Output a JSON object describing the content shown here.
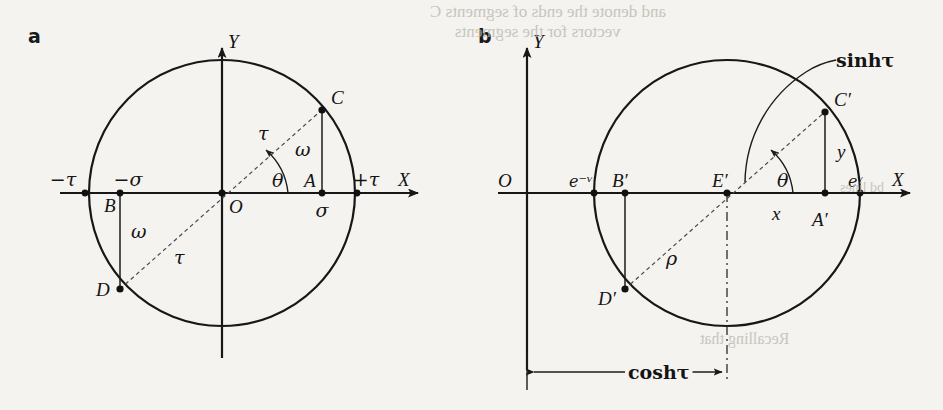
{
  "figure": {
    "background_color": "#f4f3ef",
    "ink_color": "#141414",
    "panels": [
      {
        "id": "a",
        "letter": "a",
        "type": "circle-diagram",
        "geometry": {
          "center": [
            222,
            193
          ],
          "radius": 133,
          "theta_deg": 38
        },
        "axes": {
          "x_label": "X",
          "y_label": "Y",
          "origin_label": "O"
        },
        "points": [
          {
            "name": "C",
            "label": "C",
            "x": 322,
            "y": 110
          },
          {
            "name": "A",
            "label": "A",
            "x": 322,
            "y": 193
          },
          {
            "name": "B",
            "label": "B",
            "x": 120,
            "y": 193
          },
          {
            "name": "D",
            "label": "D",
            "x": 120,
            "y": 289
          },
          {
            "name": "O",
            "label": "O",
            "x": 222,
            "y": 193
          }
        ],
        "tick_labels": [
          {
            "name": "minus-tau",
            "label": "−τ",
            "x": 85,
            "y": 193
          },
          {
            "name": "minus-sigma",
            "label": "−σ",
            "x": 120,
            "y": 193
          },
          {
            "name": "sigma",
            "label": "σ",
            "x": 322,
            "y": 193
          },
          {
            "name": "plus-tau",
            "label": "+τ",
            "x": 357,
            "y": 193
          }
        ],
        "segment_labels": [
          {
            "name": "tau-upper",
            "label": "τ",
            "x": 265,
            "y": 133
          },
          {
            "name": "tau-lower",
            "label": "τ",
            "x": 180,
            "y": 258
          },
          {
            "name": "omega-upper",
            "label": "ω",
            "x": 300,
            "y": 150
          },
          {
            "name": "omega-lower",
            "label": "ω",
            "x": 138,
            "y": 232
          },
          {
            "name": "theta",
            "label": "θ",
            "x": 278,
            "y": 180
          }
        ]
      },
      {
        "id": "b",
        "letter": "b",
        "type": "circle-diagram",
        "geometry": {
          "center": [
            727,
            193
          ],
          "radius": 133,
          "theta_deg": 38
        },
        "axes": {
          "x_label": "X",
          "y_label": "Y",
          "origin_label": "O",
          "origin_x": 527
        },
        "points": [
          {
            "name": "C-prime",
            "label": "C′",
            "x": 825,
            "y": 112
          },
          {
            "name": "A-prime",
            "label": "A′",
            "x": 825,
            "y": 193
          },
          {
            "name": "B-prime",
            "label": "B′",
            "x": 625,
            "y": 193
          },
          {
            "name": "D-prime",
            "label": "D′",
            "x": 625,
            "y": 289
          },
          {
            "name": "E-prime",
            "label": "E′",
            "x": 727,
            "y": 193
          }
        ],
        "tick_labels": [
          {
            "name": "e-minus-tau",
            "label": "e⁻ᵛ",
            "x": 594,
            "y": 193
          },
          {
            "name": "e-tau",
            "label": "eᵛ",
            "x": 860,
            "y": 193
          }
        ],
        "segment_labels": [
          {
            "name": "sinh-tau",
            "label": "sinhτ"
          },
          {
            "name": "cosh-tau",
            "label": "coshτ"
          },
          {
            "name": "rho",
            "label": "ρ",
            "x": 672,
            "y": 258
          },
          {
            "name": "x-coord",
            "label": "x",
            "x": 778,
            "y": 214
          },
          {
            "name": "y-coord",
            "label": "y",
            "x": 842,
            "y": 152
          },
          {
            "name": "theta",
            "label": "θ",
            "x": 783,
            "y": 180
          }
        ]
      }
    ],
    "ghost_text": [
      {
        "name": "ghost-line-1",
        "text": "and denote the ends of segments C",
        "x": 430,
        "y": 2,
        "size": 17
      },
      {
        "name": "ghost-line-2",
        "text": "vectors for the segments",
        "x": 455,
        "y": 22,
        "size": 17
      },
      {
        "name": "ghost-line-3",
        "text": "bd lines",
        "x": 840,
        "y": 180,
        "size": 14
      },
      {
        "name": "ghost-line-4",
        "text": "Recalling that",
        "x": 700,
        "y": 330,
        "size": 16
      }
    ]
  }
}
